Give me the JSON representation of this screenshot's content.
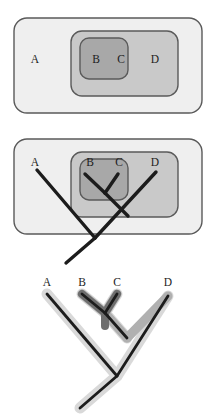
{
  "figure": {
    "taxa": [
      "A",
      "B",
      "C",
      "D"
    ],
    "colors": {
      "outer_set_fill": "#efefef",
      "middle_set_fill": "#c9c9c9",
      "inner_set_fill": "#a8a8a8",
      "set_stroke": "#5a5a5a",
      "branch_stroke": "#1c1c1c",
      "clade_band_outer": "#d9d9d9",
      "clade_band_middle": "#b0b0b0",
      "clade_band_inner": "#6e6e6e",
      "label_color": "#1c1c1c",
      "background": "#ffffff"
    }
  },
  "panel_venn": {
    "name": "nested-sets-panel",
    "sets": [
      {
        "id": "outer",
        "label_for": "A",
        "members": [
          "A",
          "B",
          "C",
          "D"
        ]
      },
      {
        "id": "middle",
        "label_for": "D",
        "members": [
          "B",
          "C",
          "D"
        ]
      },
      {
        "id": "inner",
        "label_for": "BC",
        "members": [
          "B",
          "C"
        ]
      }
    ],
    "labels": [
      {
        "text": "A",
        "x": 35,
        "y": 63
      },
      {
        "text": "B",
        "x": 96,
        "y": 63
      },
      {
        "text": "C",
        "x": 121,
        "y": 63
      },
      {
        "text": "D",
        "x": 155,
        "y": 63
      }
    ]
  },
  "panel_overlay": {
    "name": "nested-sets-with-cladogram-panel",
    "labels": [
      {
        "text": "A",
        "x": 35,
        "y": 36
      },
      {
        "text": "B",
        "x": 90,
        "y": 36
      },
      {
        "text": "C",
        "x": 119,
        "y": 36
      },
      {
        "text": "D",
        "x": 155,
        "y": 36
      }
    ]
  },
  "panel_tree": {
    "name": "cladogram-panel",
    "labels": [
      {
        "text": "A",
        "x": 47,
        "y": 18
      },
      {
        "text": "B",
        "x": 82,
        "y": 18
      },
      {
        "text": "C",
        "x": 117,
        "y": 18
      },
      {
        "text": "D",
        "x": 168,
        "y": 18
      }
    ],
    "clade_bands": [
      {
        "id": "band-bc",
        "taxa": [
          "B",
          "C"
        ],
        "shade": "inner"
      },
      {
        "id": "band-bcd",
        "taxa": [
          "B",
          "C",
          "D"
        ],
        "shade": "middle"
      },
      {
        "id": "band-abcd",
        "taxa": [
          "A",
          "B",
          "C",
          "D"
        ],
        "shade": "outer"
      }
    ]
  }
}
